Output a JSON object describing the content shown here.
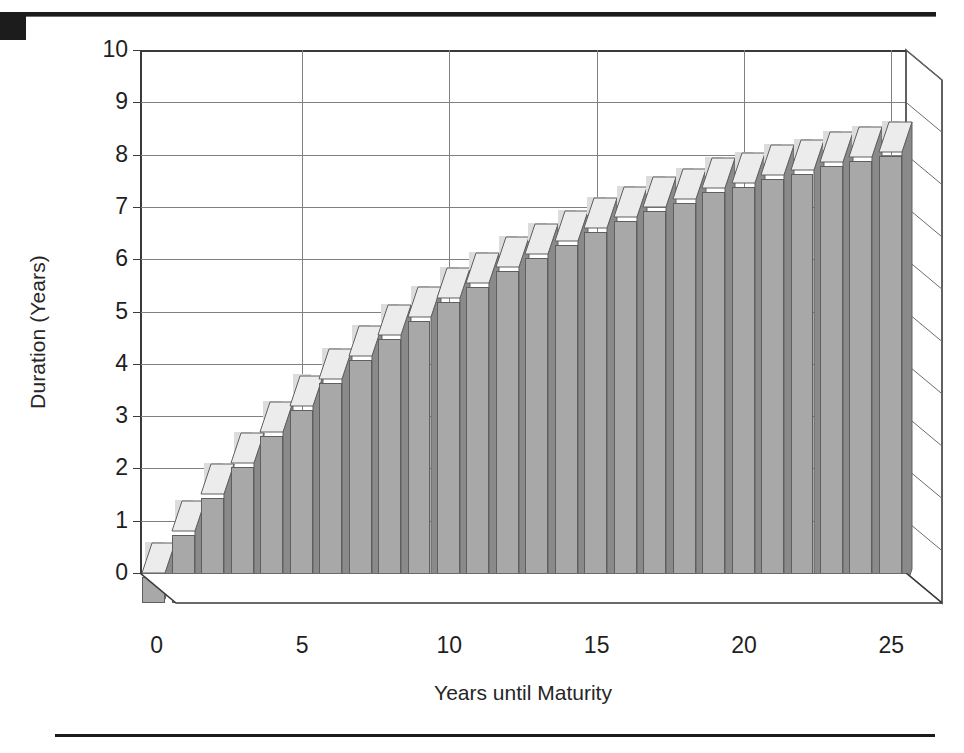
{
  "figure": {
    "decorations": {
      "top_rule": "horizontal-rule",
      "corner_block": "black-corner-block",
      "bottom_rule": "horizontal-rule"
    }
  },
  "chart_data": {
    "type": "bar",
    "title": "",
    "subtitle": "",
    "xlabel": "Years until Maturity",
    "ylabel": "Duration (Years)",
    "xlim": [
      0,
      26
    ],
    "ylim": [
      0,
      10
    ],
    "xticks": [
      "0",
      "5",
      "10",
      "15",
      "20",
      "25"
    ],
    "xtick_values": [
      0,
      5,
      10,
      15,
      20,
      25
    ],
    "yticks": [
      "0",
      "1",
      "2",
      "3",
      "4",
      "5",
      "6",
      "7",
      "8",
      "9",
      "10"
    ],
    "ytick_values": [
      0,
      1,
      2,
      3,
      4,
      5,
      6,
      7,
      8,
      9,
      10
    ],
    "grid": "horizontal-and-major-vertical",
    "legend": "none",
    "style": "3d-bar",
    "categories": [
      1,
      2,
      3,
      4,
      5,
      6,
      7,
      8,
      9,
      10,
      11,
      12,
      13,
      14,
      15,
      16,
      17,
      18,
      19,
      20,
      21,
      22,
      23,
      24,
      25,
      26
    ],
    "values": [
      0.5,
      1.3,
      2.0,
      2.6,
      3.2,
      3.7,
      4.2,
      4.65,
      5.05,
      5.4,
      5.75,
      6.05,
      6.35,
      6.6,
      6.85,
      7.1,
      7.3,
      7.5,
      7.65,
      7.85,
      7.95,
      8.1,
      8.2,
      8.35,
      8.45,
      8.55
    ],
    "series": [
      {
        "name": "Duration",
        "values": [
          0.5,
          1.3,
          2.0,
          2.6,
          3.2,
          3.7,
          4.2,
          4.65,
          5.05,
          5.4,
          5.75,
          6.05,
          6.35,
          6.6,
          6.85,
          7.1,
          7.3,
          7.5,
          7.65,
          7.85,
          7.95,
          8.1,
          8.2,
          8.35,
          8.45,
          8.55
        ]
      }
    ],
    "colors": {
      "bar_front": "#a8a8a8",
      "bar_side": "#8a8a8a",
      "bar_top": "#ececec",
      "bar_shadow": "#dcdcdc",
      "grid": "#808080",
      "axis": "#3a3a3a",
      "text": "#1f1f1f",
      "rule": "#1c1c1c"
    }
  }
}
